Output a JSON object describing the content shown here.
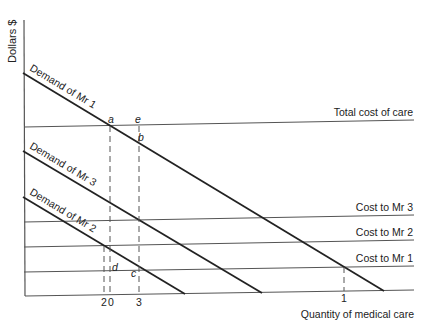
{
  "diagram": {
    "title": "",
    "y_axis_label": "Dollars $",
    "x_axis_label": "Quantity of medical care",
    "demand_curves": [
      {
        "label": "Demand of Mr 1"
      },
      {
        "label": "Demand of Mr 3"
      },
      {
        "label": "Demand of Mr 2"
      }
    ],
    "cost_lines": [
      {
        "label": "Total cost of care"
      },
      {
        "label": "Cost to Mr 3"
      },
      {
        "label": "Cost to Mr 2"
      },
      {
        "label": "Cost to Mr 1"
      }
    ],
    "points": {
      "a": "a",
      "b": "b",
      "c": "c",
      "d": "d",
      "e": "e"
    },
    "x_ticks": {
      "two": "2",
      "zero": "0",
      "three": "3",
      "one": "1"
    }
  }
}
